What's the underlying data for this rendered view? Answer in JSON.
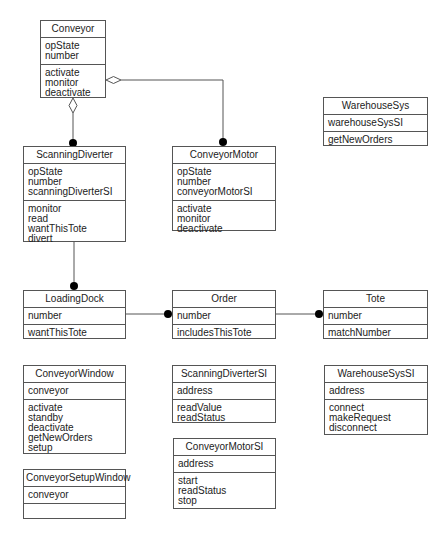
{
  "diagram": {
    "type": "UML class diagram",
    "classes": [
      {
        "id": "conveyor",
        "name": "Conveyor",
        "attributes": [
          "opState",
          "number"
        ],
        "operations": [
          "activate",
          "monitor",
          "deactivate"
        ],
        "box": {
          "x": 40,
          "y": 20,
          "w": 66,
          "h": 78
        }
      },
      {
        "id": "warehouseSys",
        "name": "WarehouseSys",
        "attributes": [
          "warehouseSysSI"
        ],
        "operations": [
          "getNewOrders"
        ],
        "box": {
          "x": 323,
          "y": 97,
          "w": 105,
          "h": 49
        }
      },
      {
        "id": "scanningDiverter",
        "name": "ScanningDiverter",
        "attributes": [
          "opState",
          "number",
          "scanningDiverterSI"
        ],
        "operations": [
          "monitor",
          "read",
          "wantThisTote",
          "divert"
        ],
        "box": {
          "x": 23,
          "y": 146,
          "w": 103,
          "h": 96
        }
      },
      {
        "id": "conveyorMotor",
        "name": "ConveyorMotor",
        "attributes": [
          "opState",
          "number",
          "conveyorMotorSI"
        ],
        "operations": [
          "activate",
          "monitor",
          "deactivate"
        ],
        "box": {
          "x": 172,
          "y": 146,
          "w": 104,
          "h": 85
        }
      },
      {
        "id": "loadingDock",
        "name": "LoadingDock",
        "attributes": [
          "number"
        ],
        "operations": [
          "wantThisTote"
        ],
        "box": {
          "x": 23,
          "y": 290,
          "w": 103,
          "h": 49
        }
      },
      {
        "id": "order",
        "name": "Order",
        "attributes": [
          "number"
        ],
        "operations": [
          "includesThisTote"
        ],
        "box": {
          "x": 172,
          "y": 290,
          "w": 104,
          "h": 49
        }
      },
      {
        "id": "tote",
        "name": "Tote",
        "attributes": [
          "number"
        ],
        "operations": [
          "matchNumber"
        ],
        "box": {
          "x": 323,
          "y": 290,
          "w": 105,
          "h": 49
        }
      },
      {
        "id": "conveyorWindow",
        "name": "ConveyorWindow",
        "attributes": [
          "conveyor"
        ],
        "operations": [
          "activate",
          "standby",
          "deactivate",
          "getNewOrders",
          "setup"
        ],
        "box": {
          "x": 23,
          "y": 365,
          "w": 103,
          "h": 89
        }
      },
      {
        "id": "scanningDiverterSI",
        "name": "ScanningDiverterSI",
        "attributes": [
          "address"
        ],
        "operations": [
          "readValue",
          "readStatus"
        ],
        "box": {
          "x": 172,
          "y": 365,
          "w": 104,
          "h": 58
        }
      },
      {
        "id": "warehouseSysSI",
        "name": "WarehouseSysSI",
        "attributes": [
          "address"
        ],
        "operations": [
          "connect",
          "makeRequest",
          "disconnect"
        ],
        "box": {
          "x": 324,
          "y": 365,
          "w": 104,
          "h": 70
        }
      },
      {
        "id": "conveyorMotorSI",
        "name": "ConveyorMotorSI",
        "attributes": [
          "address"
        ],
        "operations": [
          "start",
          "readStatus",
          "stop"
        ],
        "box": {
          "x": 173,
          "y": 438,
          "w": 103,
          "h": 71
        }
      },
      {
        "id": "conveyorSetupWindow",
        "name": "ConveyorSetupWindow",
        "attributes": [
          "conveyor"
        ],
        "operations": [],
        "box": {
          "x": 23,
          "y": 469,
          "w": 103,
          "h": 50
        }
      }
    ],
    "relationships": [
      {
        "type": "aggregation",
        "from": "Conveyor",
        "to": "ScanningDiverter",
        "whole_end": "hollow-diamond",
        "part_end": "filled-dot-many"
      },
      {
        "type": "aggregation",
        "from": "Conveyor",
        "to": "ConveyorMotor",
        "whole_end": "hollow-diamond",
        "part_end": "filled-dot-many"
      },
      {
        "type": "association",
        "from": "ScanningDiverter",
        "to": "LoadingDock",
        "end": "filled-dot-many"
      },
      {
        "type": "association",
        "from": "LoadingDock",
        "to": "Order",
        "end": "filled-dot-many"
      },
      {
        "type": "association",
        "from": "Order",
        "to": "Tote",
        "end": "filled-dot-many"
      }
    ],
    "colors": {
      "line": "#555555",
      "fill": "#ffffff",
      "text": "#222222",
      "dot": "#000000"
    }
  }
}
